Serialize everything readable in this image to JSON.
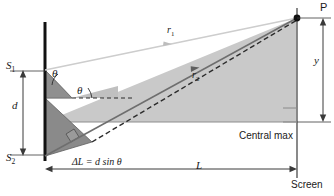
{
  "figure": {
    "type": "physics-diagram",
    "colors": {
      "beam_fill": "#c9c9c9",
      "wedge_dark": "#8a8a8a",
      "wedge_mid": "#a8a8a8",
      "barrier": "#111111",
      "ray_r1": "#cfcfcf",
      "ray_r2": "#777777",
      "dimension_line": "#3a3a3a",
      "background": "#ffffff"
    }
  },
  "labels": {
    "slit_top": "S",
    "slit_top_sub": "1",
    "slit_bottom": "S",
    "slit_bottom_sub": "2",
    "separation": "d",
    "theta_upper": "θ",
    "theta_lower": "θ",
    "ray_one": "r",
    "ray_one_sub": "1",
    "ray_two": "r",
    "ray_two_sub": "2",
    "path_difference": "ΔL = d sin θ",
    "distance_to_screen": "L",
    "height_on_screen": "y",
    "central_max": "Central max",
    "point_p": "P",
    "screen": "Screen"
  }
}
